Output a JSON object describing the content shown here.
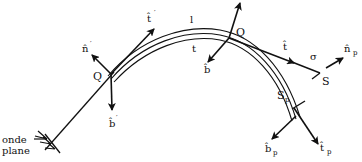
{
  "diagram": {
    "labels": {
      "onde_plane_line1": "onde",
      "onde_plane_line2": "plane",
      "q_prime": "Q",
      "q_prime_mark": "′",
      "q": "Q",
      "n_prime": "n̂",
      "n_prime_mark": "′",
      "t_prime": "t̂",
      "t_prime_mark": "′",
      "b_prime": "b̂",
      "b_prime_mark": "′",
      "l": "l",
      "t": "t",
      "b": "b̂",
      "t_hat": "t̂",
      "sigma": "σ",
      "s": "S",
      "n_p": "n̂",
      "n_p_sub": "p",
      "s_p": "S",
      "s_p_sub": "p",
      "b_p": "b̂",
      "b_p_sub": "p",
      "t_p": "t̂",
      "t_p_sub": "p"
    },
    "colors": {
      "ink": "#111111",
      "background": "#ffffff"
    }
  }
}
